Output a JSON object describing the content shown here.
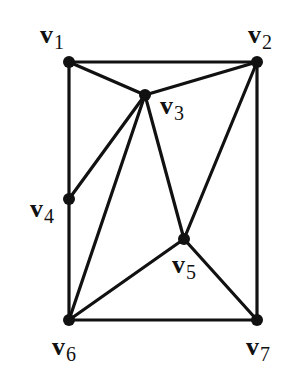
{
  "graph": {
    "nodes": [
      {
        "id": "v1",
        "base": "v",
        "sub": "1",
        "x": 69,
        "y": 62,
        "lx": 40,
        "ly": 22
      },
      {
        "id": "v2",
        "base": "v",
        "sub": "2",
        "x": 257,
        "y": 62,
        "lx": 248,
        "ly": 22
      },
      {
        "id": "v3",
        "base": "v",
        "sub": "3",
        "x": 145,
        "y": 95,
        "lx": 160,
        "ly": 93
      },
      {
        "id": "v4",
        "base": "v",
        "sub": "4",
        "x": 69,
        "y": 199,
        "lx": 30,
        "ly": 196
      },
      {
        "id": "v5",
        "base": "v",
        "sub": "5",
        "x": 184,
        "y": 239,
        "lx": 172,
        "ly": 252
      },
      {
        "id": "v6",
        "base": "v",
        "sub": "6",
        "x": 69,
        "y": 320,
        "lx": 52,
        "ly": 334
      },
      {
        "id": "v7",
        "base": "v",
        "sub": "7",
        "x": 257,
        "y": 320,
        "lx": 246,
        "ly": 334
      }
    ],
    "edges": [
      [
        "v1",
        "v2"
      ],
      [
        "v1",
        "v3"
      ],
      [
        "v1",
        "v4"
      ],
      [
        "v2",
        "v3"
      ],
      [
        "v2",
        "v5"
      ],
      [
        "v2",
        "v7"
      ],
      [
        "v3",
        "v4"
      ],
      [
        "v3",
        "v6"
      ],
      [
        "v3",
        "v5"
      ],
      [
        "v4",
        "v6"
      ],
      [
        "v5",
        "v6"
      ],
      [
        "v5",
        "v7"
      ],
      [
        "v6",
        "v7"
      ]
    ],
    "colors": {
      "stroke": "#111111",
      "background": "#ffffff"
    }
  },
  "labels": {
    "v1": {
      "base": "v",
      "sub": "1"
    },
    "v2": {
      "base": "v",
      "sub": "2"
    },
    "v3": {
      "base": "v",
      "sub": "3"
    },
    "v4": {
      "base": "v",
      "sub": "4"
    },
    "v5": {
      "base": "v",
      "sub": "5"
    },
    "v6": {
      "base": "v",
      "sub": "6"
    },
    "v7": {
      "base": "v",
      "sub": "7"
    }
  }
}
